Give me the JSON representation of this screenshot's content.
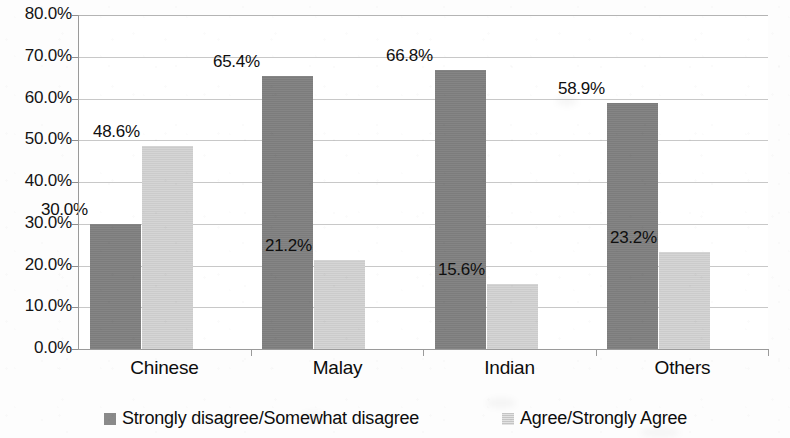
{
  "chart_data": {
    "type": "bar",
    "title": "",
    "subtitle": "",
    "xlabel": "",
    "ylabel": "",
    "categories": [
      "Chinese",
      "Malay",
      "Indian",
      "Others"
    ],
    "series": [
      {
        "name": "Strongly disagree/Somewhat disagree",
        "color": "#808080",
        "values": [
          30.0,
          65.4,
          66.8,
          58.9
        ],
        "labels": [
          "30.0%",
          "65.4%",
          "66.8%",
          "58.9%"
        ]
      },
      {
        "name": "Agree/Strongly Agree",
        "color": "#d2d2d2",
        "values": [
          48.6,
          21.2,
          15.6,
          23.2
        ],
        "labels": [
          "48.6%",
          "21.2%",
          "15.6%",
          "23.2%"
        ]
      }
    ],
    "ylim": [
      0,
      80
    ],
    "ytick_step": 10,
    "ytick_labels": [
      "80.0%",
      "70.0%",
      "60.0%",
      "50.0%",
      "40.0%",
      "30.0%",
      "20.0%",
      "10.0%",
      "0.0%"
    ],
    "ytick_values": [
      80,
      70,
      60,
      50,
      40,
      30,
      20,
      10,
      0
    ],
    "grid": true,
    "grid_axis": "y",
    "legend_position": "bottom",
    "legend_entries": [
      "Strongly disagree/Somewhat disagree",
      "Agree/Strongly Agree"
    ]
  },
  "colors": {
    "series_dark": "#808080",
    "series_light": "#d2d2d2",
    "gridline": "#c8c8c8",
    "axis": "#9a9a9a",
    "text": "#111111",
    "background": "#ffffff"
  }
}
